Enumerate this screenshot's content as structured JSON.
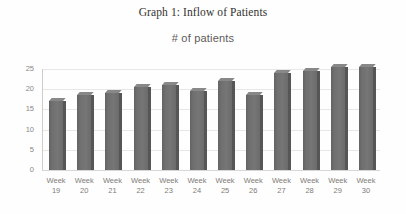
{
  "chart_data": {
    "type": "bar",
    "title": "Graph 1: Inflow of Patients",
    "subtitle": "# of patients",
    "xlabel": "",
    "ylabel": "# of patients",
    "ylim": [
      0,
      25
    ],
    "yticks": [
      0,
      5,
      10,
      15,
      20,
      25
    ],
    "ytick_labels": [
      "0",
      "5",
      "10",
      "15",
      "20",
      "25"
    ],
    "grid": true,
    "legend": false,
    "bar_color": "#6f6f6f",
    "bar_top_color": "#888888",
    "bar_side_color": "#565656",
    "gridline_color": "#e9e7e4",
    "category_prefix": "Week",
    "categories": [
      "Week 19",
      "Week 20",
      "Week 21",
      "Week 22",
      "Week 23",
      "Week 24",
      "Week 25",
      "Week 26",
      "Week 27",
      "Week 28",
      "Week 29",
      "Week 30"
    ],
    "category_lines": [
      {
        "line1": "Week",
        "line2": "19"
      },
      {
        "line1": "Week",
        "line2": "20"
      },
      {
        "line1": "Week",
        "line2": "21"
      },
      {
        "line1": "Week",
        "line2": "22"
      },
      {
        "line1": "Week",
        "line2": "23"
      },
      {
        "line1": "Week",
        "line2": "24"
      },
      {
        "line1": "Week",
        "line2": "25"
      },
      {
        "line1": "Week",
        "line2": "26"
      },
      {
        "line1": "Week",
        "line2": "27"
      },
      {
        "line1": "Week",
        "line2": "28"
      },
      {
        "line1": "Week",
        "line2": "29"
      },
      {
        "line1": "Week",
        "line2": "30"
      }
    ],
    "values": [
      17,
      18.5,
      19,
      20.5,
      21,
      19.5,
      22,
      18.5,
      24,
      24.5,
      25.5,
      25.5
    ]
  }
}
